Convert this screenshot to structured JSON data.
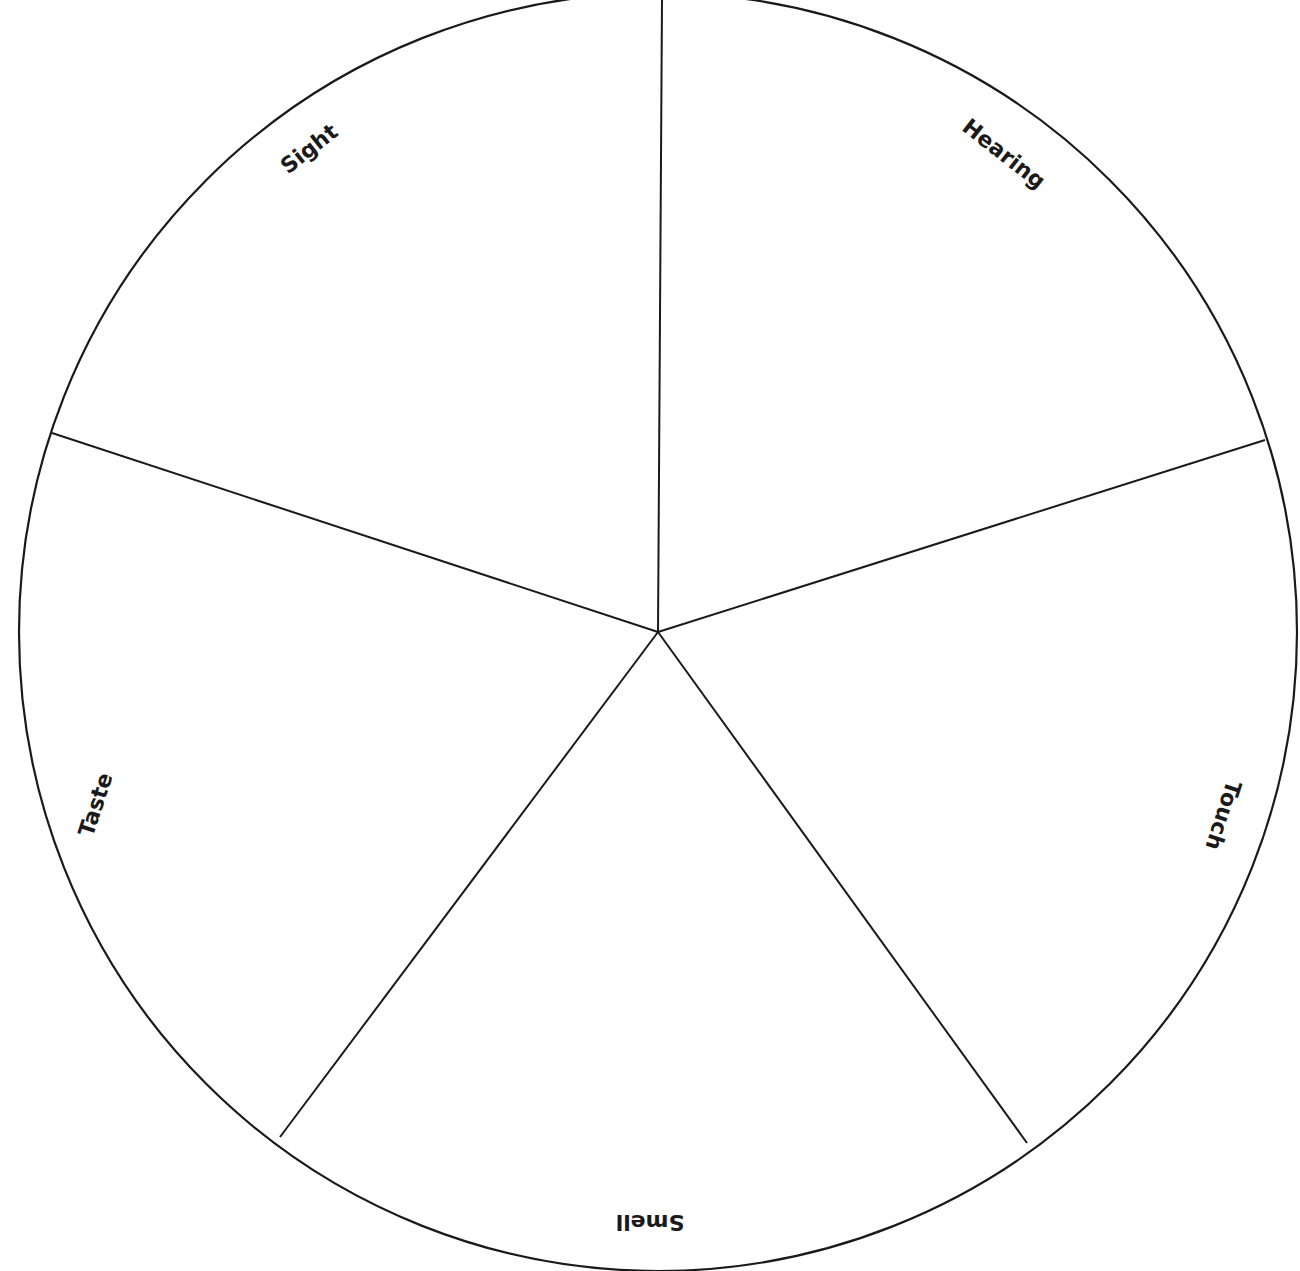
{
  "diagram": {
    "type": "pie-wheel",
    "title": "",
    "stroke_color": "#1a1a1a",
    "background": "#ffffff",
    "circle": {
      "cx": 658,
      "cy": 632,
      "r": 639
    },
    "spokes": [
      {
        "x": 662,
        "y": 0
      },
      {
        "x": 1265,
        "y": 440
      },
      {
        "x": 1027,
        "y": 1143
      },
      {
        "x": 280,
        "y": 1137
      },
      {
        "x": 52,
        "y": 433
      }
    ],
    "sectors": [
      {
        "label": "Sight",
        "x": 310,
        "y": 150,
        "rotate": -38
      },
      {
        "label": "Hearing",
        "x": 1003,
        "y": 155,
        "rotate": 38
      },
      {
        "label": "Touch",
        "x": 1222,
        "y": 815,
        "rotate": 108
      },
      {
        "label": "Smell",
        "x": 650,
        "y": 1221,
        "rotate": 180
      },
      {
        "label": "Taste",
        "x": 97,
        "y": 805,
        "rotate": -72
      }
    ]
  }
}
